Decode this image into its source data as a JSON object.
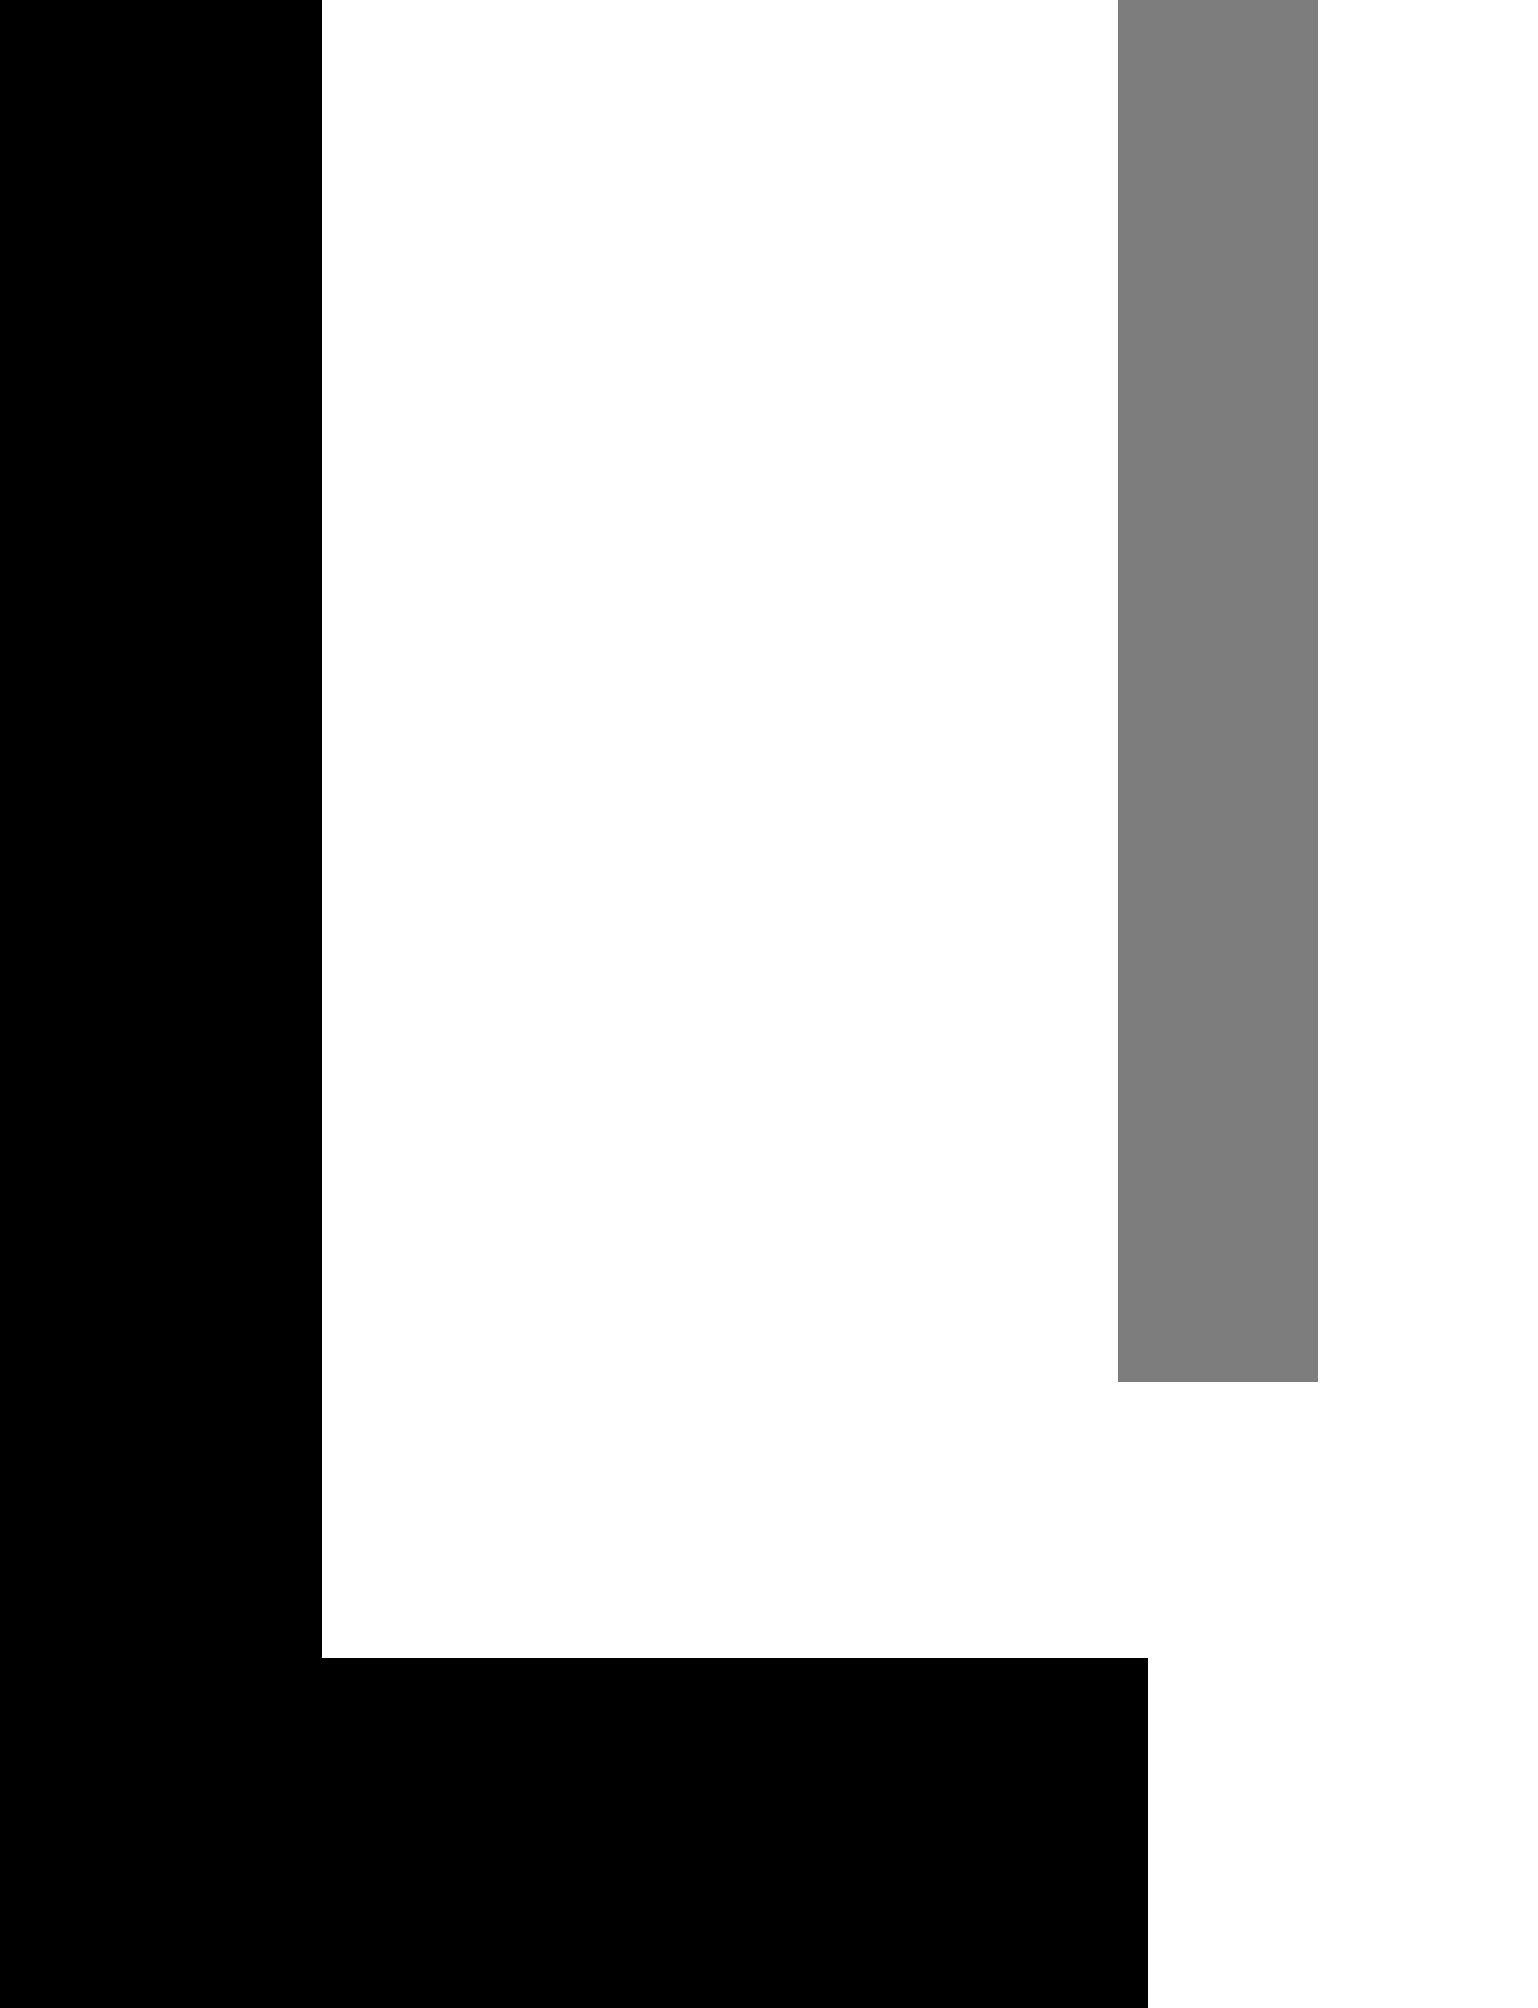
{
  "document": {
    "width": 1538,
    "height": 2008,
    "background_color": "#ffffff",
    "state_label": "",
    "visible_text": ""
  },
  "palette": {
    "chrome_black": "#000000",
    "page_white": "#ffffff",
    "placeholder_gray": "#7d7d7d"
  },
  "regions": {
    "left_chrome": {
      "name": "left-chrome-column",
      "color": "#000000",
      "x": 0,
      "y": 0,
      "width": 322,
      "height": 2008,
      "label": ""
    },
    "bottom_chrome": {
      "name": "bottom-chrome-band",
      "color": "#000000",
      "x": 322,
      "y": 1658,
      "width": 826,
      "height": 350,
      "label": ""
    },
    "page_surface": {
      "name": "page-surface",
      "color": "#ffffff",
      "x": 322,
      "y": 0,
      "width": 1216,
      "height": 1658,
      "label": ""
    },
    "placeholder_block": {
      "name": "gray-placeholder-block",
      "color": "#7d7d7d",
      "x": 1118,
      "y": 0,
      "width": 200,
      "height": 1382,
      "label": ""
    },
    "right_margin": {
      "name": "right-margin-white",
      "color": "#ffffff",
      "x": 1318,
      "y": 0,
      "width": 220,
      "height": 2008,
      "label": ""
    },
    "bottom_right_margin": {
      "name": "bottom-right-margin-white",
      "color": "#ffffff",
      "x": 1148,
      "y": 1658,
      "width": 390,
      "height": 350,
      "label": ""
    },
    "content_area": {
      "name": "page-content-area",
      "color": "#ffffff",
      "x": 322,
      "y": 0,
      "width": 796,
      "height": 1658,
      "label": ""
    }
  }
}
